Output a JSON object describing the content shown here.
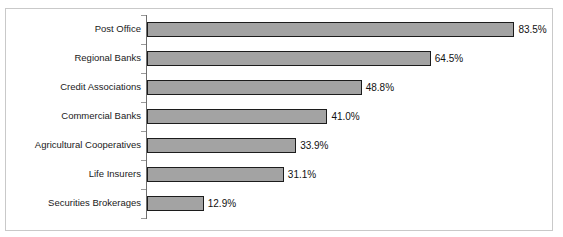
{
  "chart_data": {
    "type": "bar",
    "orientation": "horizontal",
    "title": "",
    "subtitle": "",
    "xlabel": "",
    "ylabel": "",
    "categories": [
      "Post Office",
      "Regional Banks",
      "Credit Associations",
      "Commercial Banks",
      "Agricultural Cooperatives",
      "Life Insurers",
      "Securities Brokerages"
    ],
    "values": [
      83.5,
      64.5,
      48.8,
      41.0,
      33.9,
      31.1,
      12.9
    ],
    "value_labels": [
      "83.5%",
      "64.5%",
      "48.8%",
      "41.0%",
      "33.9%",
      "31.1%",
      "12.9%"
    ],
    "units": "percent",
    "xlim": [
      0,
      93.5
    ],
    "grid": false,
    "legend": null,
    "tick_labels_x": [],
    "bar_fill_color": "#a3a3a3",
    "bar_border_color": "#1c1c1c",
    "axis_color": "#6e6e6e",
    "frame_color": "#c9c9c9",
    "background_color": "#ffffff"
  }
}
